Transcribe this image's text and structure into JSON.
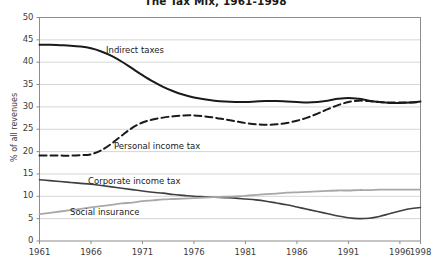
{
  "chart_data": {
    "type": "line",
    "title": "The Tax Mix, 1961-1998",
    "xlabel": "",
    "ylabel": "% of all revenues",
    "xlim": [
      1961,
      1998
    ],
    "ylim": [
      0,
      50
    ],
    "ytick_step": 5,
    "grid": true,
    "legend_position": "inline-annotations",
    "xticks": [
      "1961",
      "1966",
      "1971",
      "1976",
      "1981",
      "1986",
      "1991",
      "1996",
      "1998"
    ],
    "yticks": [
      "0",
      "5",
      "10",
      "15",
      "20",
      "25",
      "30",
      "35",
      "40",
      "45",
      "50"
    ],
    "x": [
      1961,
      1962,
      1963,
      1964,
      1965,
      1966,
      1967,
      1968,
      1969,
      1970,
      1971,
      1972,
      1973,
      1974,
      1975,
      1976,
      1977,
      1978,
      1979,
      1980,
      1981,
      1982,
      1983,
      1984,
      1985,
      1986,
      1987,
      1988,
      1989,
      1990,
      1991,
      1992,
      1993,
      1994,
      1995,
      1996,
      1997,
      1998
    ],
    "series": [
      {
        "name": "Indirect taxes",
        "style": "solid",
        "color": "#1a1a1a",
        "width": 2.0,
        "values": [
          43.9,
          43.9,
          43.8,
          43.7,
          43.5,
          43.1,
          42.4,
          41.4,
          40.1,
          38.6,
          37.1,
          35.7,
          34.5,
          33.5,
          32.7,
          32.1,
          31.7,
          31.4,
          31.2,
          31.1,
          31.1,
          31.2,
          31.3,
          31.3,
          31.2,
          31.1,
          31.0,
          31.1,
          31.4,
          31.8,
          32.0,
          31.8,
          31.4,
          31.1,
          30.9,
          30.9,
          31.0,
          31.2
        ]
      },
      {
        "name": "Personal income tax",
        "style": "dashed",
        "color": "#1a1a1a",
        "width": 2.0,
        "values": [
          19.1,
          19.1,
          19.1,
          19.1,
          19.2,
          19.4,
          20.3,
          21.8,
          23.6,
          25.3,
          26.5,
          27.2,
          27.6,
          27.9,
          28.1,
          28.1,
          27.9,
          27.6,
          27.2,
          26.8,
          26.4,
          26.1,
          26.0,
          26.1,
          26.4,
          26.9,
          27.6,
          28.5,
          29.5,
          30.4,
          31.1,
          31.4,
          31.3,
          31.1,
          31.0,
          31.0,
          31.0,
          31.1
        ]
      },
      {
        "name": "Corporate income tax",
        "style": "solid",
        "color": "#3f3f3f",
        "width": 1.6,
        "values": [
          13.7,
          13.5,
          13.3,
          13.1,
          12.9,
          12.7,
          12.4,
          12.1,
          11.8,
          11.5,
          11.2,
          10.9,
          10.7,
          10.4,
          10.2,
          10.0,
          9.9,
          9.8,
          9.7,
          9.6,
          9.4,
          9.2,
          8.9,
          8.5,
          8.1,
          7.6,
          7.1,
          6.6,
          6.1,
          5.6,
          5.2,
          5.0,
          5.1,
          5.5,
          6.1,
          6.7,
          7.2,
          7.5
        ]
      },
      {
        "name": "Social insurance",
        "style": "solid",
        "color": "#a8a8a8",
        "width": 1.8,
        "values": [
          6.0,
          6.3,
          6.6,
          6.9,
          7.2,
          7.5,
          7.8,
          8.1,
          8.4,
          8.6,
          8.9,
          9.1,
          9.3,
          9.4,
          9.5,
          9.6,
          9.7,
          9.8,
          9.9,
          10.0,
          10.1,
          10.3,
          10.5,
          10.6,
          10.8,
          10.9,
          11.0,
          11.1,
          11.2,
          11.3,
          11.3,
          11.4,
          11.4,
          11.5,
          11.5,
          11.5,
          11.5,
          11.5
        ]
      }
    ],
    "annotations": [
      {
        "text": "Indirect taxes",
        "x_px": 106,
        "y_px": 45
      },
      {
        "text": "Personal income tax",
        "x_px": 114,
        "y_px": 141
      },
      {
        "text": "Corporate income tax",
        "x_px": 88,
        "y_px": 176
      },
      {
        "text": "Social insurance",
        "x_px": 70,
        "y_px": 207
      }
    ]
  }
}
